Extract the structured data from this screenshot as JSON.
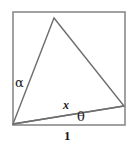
{
  "figure": {
    "canvas": {
      "width": 137,
      "height": 147,
      "background": "#ffffff"
    },
    "stroke_color": "#8a8a8a",
    "stroke_color_triangle": "#6e6e6e",
    "label_color": "#1a1a1a",
    "square": {
      "name": "unit-square",
      "x": 13,
      "y": 12,
      "width": 112,
      "height": 113,
      "side_label": "1"
    },
    "triangle": {
      "name": "inscribed-triangle",
      "vertices": [
        {
          "name": "bottom-left-corner",
          "x": 13,
          "y": 124
        },
        {
          "name": "apex-on-top-edge",
          "x": 54,
          "y": 18
        },
        {
          "name": "point-on-right-edge",
          "x": 124,
          "y": 106
        }
      ]
    },
    "chord": {
      "name": "segment-x",
      "from": {
        "x": 13,
        "y": 124
      },
      "to": {
        "x": 124,
        "y": 106
      },
      "label": "x"
    },
    "labels": {
      "alpha": "α",
      "theta": "θ",
      "x": "x",
      "one": "1"
    }
  }
}
